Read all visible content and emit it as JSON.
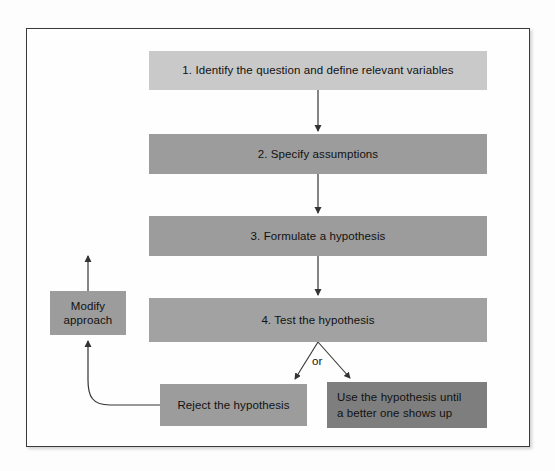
{
  "figure": {
    "type": "flowchart",
    "orientation": "top-to-bottom with feedback loop",
    "colors": {
      "node_light": "#c9c9c9",
      "node_mid": "#9c9c9c",
      "node_mid_b": "#a2a2a2",
      "node_dark": "#7e7e7e",
      "frame": "#3a3a3a",
      "text": "#111111",
      "connector": "#333333",
      "background": "#fefefe"
    }
  },
  "nodes": {
    "step1": {
      "label": "1. Identify the question and define relevant variables",
      "shade": "light"
    },
    "step2": {
      "label": "2. Specify assumptions",
      "shade": "mid"
    },
    "step3": {
      "label": "3. Formulate a hypothesis",
      "shade": "mid"
    },
    "step4": {
      "label": "4. Test the hypothesis",
      "shade": "midb"
    },
    "modify": {
      "label": "Modify\napproach",
      "line1": "Modify",
      "line2": "approach",
      "shade": "mid"
    },
    "reject": {
      "label": "Reject the hypothesis",
      "shade": "mid"
    },
    "use": {
      "label": "Use the hypothesis until a better one shows up",
      "line1": "Use the hypothesis until",
      "line2": "a better one shows up",
      "shade": "dark"
    }
  },
  "connectors": {
    "branch_label": "or",
    "edges": [
      {
        "from": "step1",
        "to": "step2",
        "kind": "arrow-down"
      },
      {
        "from": "step2",
        "to": "step3",
        "kind": "arrow-down"
      },
      {
        "from": "step3",
        "to": "step4",
        "kind": "arrow-down"
      },
      {
        "from": "step4",
        "to": "reject",
        "kind": "arrow-diagonal-left"
      },
      {
        "from": "step4",
        "to": "use",
        "kind": "arrow-diagonal-right"
      },
      {
        "from": "reject",
        "to": "modify",
        "kind": "arrow-curved-up-left"
      },
      {
        "from": "modify",
        "to": "step3",
        "kind": "arrow-up"
      }
    ]
  }
}
